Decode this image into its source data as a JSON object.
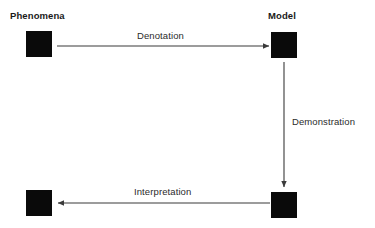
{
  "diagram": {
    "background_color": "#ffffff",
    "node_fill_color": "#0a0a0a",
    "line_color": "#3a3a3a",
    "text_color": "#1a1a1a",
    "nodes": [
      {
        "id": "phenomena",
        "label": "Phenomena",
        "label_visible": true
      },
      {
        "id": "model",
        "label": "Model",
        "label_visible": true
      },
      {
        "id": "artifact",
        "label": "",
        "label_visible": false
      },
      {
        "id": "outcome",
        "label": "",
        "label_visible": false
      }
    ],
    "edges": [
      {
        "id": "denotation",
        "label": "Denotation",
        "from": "phenomena",
        "to": "model",
        "direction": "right"
      },
      {
        "id": "demonstration",
        "label": "Demonstration",
        "from": "model",
        "to": "artifact",
        "direction": "down"
      },
      {
        "id": "interpretation",
        "label": "Interpretation",
        "from": "artifact",
        "to": "outcome",
        "direction": "left"
      }
    ]
  }
}
